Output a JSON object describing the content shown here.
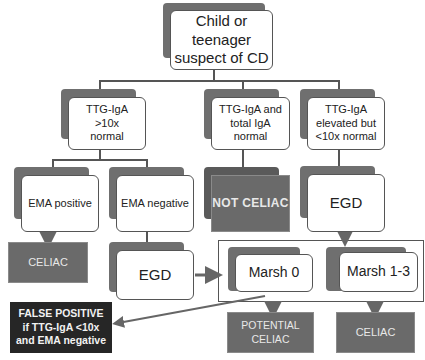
{
  "diagram": {
    "root": {
      "label": "Child or teenager suspect of CD"
    },
    "level1": [
      {
        "id": "ttg-high",
        "label": "TTG-IgA >10x normal"
      },
      {
        "id": "ttg-normal",
        "label": "TTG-IgA and total IgA normal"
      },
      {
        "id": "ttg-elevated",
        "label": "TTG-IgA elevated but <10x normal"
      }
    ],
    "level2": {
      "ema_positive": "EMA positive",
      "ema_negative": "EMA negative",
      "not_celiac": "NOT CELIAC",
      "egd_right": "EGD"
    },
    "level3": {
      "celiac_left": "CELIAC",
      "egd_left": "EGD",
      "marsh0": "Marsh 0",
      "marsh13": "Marsh 1-3"
    },
    "outcomes": {
      "false_positive": "FALSE POSITIVE if TTG-IgA <10x and EMA negative",
      "potential_celiac": "POTENTIAL CELIAC",
      "celiac_right": "CELIAC"
    },
    "colors": {
      "shadow": "#6f6f6f",
      "terminal_gray": "#6a6a6a",
      "terminal_dark": "#262626",
      "line": "#555555"
    }
  }
}
